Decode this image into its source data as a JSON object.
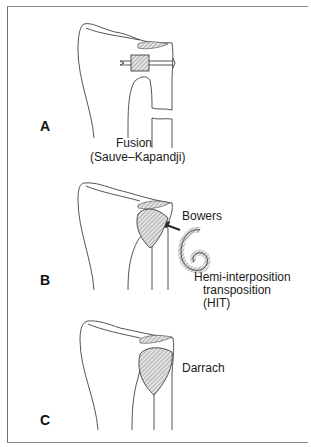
{
  "panels": [
    {
      "letter": "A",
      "caption_line1": "Fusion",
      "caption_line2": "(Sauve–Kapandji)"
    },
    {
      "letter": "B",
      "label_top": "Bowers",
      "label_bottom_line1": "Hemi-interposition",
      "label_bottom_line2": "transposition",
      "label_bottom_line3": "(HIT)"
    },
    {
      "letter": "C",
      "label": "Darrach"
    }
  ],
  "colors": {
    "line": "#2a2a2a",
    "hatch": "#9a9a9a",
    "frame": "#7a7a7a"
  }
}
